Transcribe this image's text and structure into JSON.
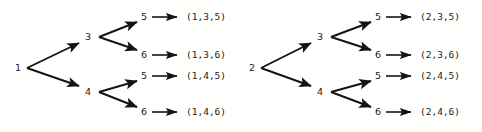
{
  "canvas": {
    "width": 482,
    "height": 132,
    "background": "#fffffd",
    "ink": "#141414"
  },
  "diagram": {
    "type": "tree-diagram",
    "arrow_glyph": "right-arrow",
    "trees": [
      {
        "id": "tree-left",
        "root": {
          "label": "1",
          "x": 18,
          "y": 68
        },
        "branches": [
          {
            "label": "3",
            "x": 88,
            "y": 37,
            "leaves": [
              {
                "label": "5",
                "x": 144,
                "y": 17,
                "result": "(1,3,5)",
                "result_x": 186
              },
              {
                "label": "6",
                "x": 144,
                "y": 55,
                "result": "(1,3,6)",
                "result_x": 186
              }
            ]
          },
          {
            "label": "4",
            "x": 88,
            "y": 92,
            "leaves": [
              {
                "label": "5",
                "x": 144,
                "y": 76,
                "result": "(1,4,5)",
                "result_x": 186
              },
              {
                "label": "6",
                "x": 144,
                "y": 112,
                "result": "(1,4,6)",
                "result_x": 186
              }
            ]
          }
        ]
      },
      {
        "id": "tree-right",
        "root": {
          "label": "2",
          "x": 252,
          "y": 68
        },
        "branches": [
          {
            "label": "3",
            "x": 320,
            "y": 37,
            "leaves": [
              {
                "label": "5",
                "x": 378,
                "y": 17,
                "result": "(2,3,5)",
                "result_x": 420
              },
              {
                "label": "6",
                "x": 378,
                "y": 55,
                "result": "(2,3,6)",
                "result_x": 420
              }
            ]
          },
          {
            "label": "4",
            "x": 320,
            "y": 92,
            "leaves": [
              {
                "label": "5",
                "x": 378,
                "y": 76,
                "result": "(2,4,5)",
                "result_x": 420
              },
              {
                "label": "6",
                "x": 378,
                "y": 112,
                "result": "(2,4,6)",
                "result_x": 420
              }
            ]
          }
        ]
      }
    ],
    "outcomes": [
      "(1,3,5)",
      "(1,3,6)",
      "(1,4,5)",
      "(1,4,6)",
      "(2,3,5)",
      "(2,3,6)",
      "(2,4,5)",
      "(2,4,6)"
    ],
    "level_values": {
      "level1": [
        "1",
        "2"
      ],
      "level2": [
        "3",
        "4"
      ],
      "level3": [
        "5",
        "6"
      ]
    }
  }
}
